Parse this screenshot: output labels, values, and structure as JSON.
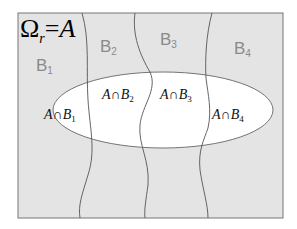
{
  "title": {
    "omega": "Ω",
    "subscript": "r",
    "equals": "=",
    "set": "A"
  },
  "partitions": [
    {
      "name": "B",
      "index": "1"
    },
    {
      "name": "B",
      "index": "2"
    },
    {
      "name": "B",
      "index": "3"
    },
    {
      "name": "B",
      "index": "4"
    }
  ],
  "intersections": [
    {
      "left": "A∩B",
      "index": "1"
    },
    {
      "left": "A∩B",
      "index": "2"
    },
    {
      "left": "A∩B",
      "index": "3"
    },
    {
      "left": "A∩B",
      "index": "4"
    }
  ],
  "colors": {
    "background_region": "#e4e4e4",
    "ellipse_fill": "#ffffff",
    "lines": "#555555",
    "partition_label": "#8a8a8a"
  }
}
